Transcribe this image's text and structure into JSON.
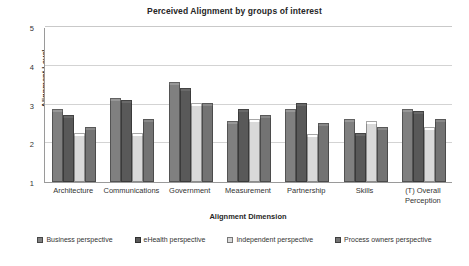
{
  "chart_data": {
    "type": "bar",
    "title": "Perceived Alignment by groups of interest",
    "xlabel": "Alignment Dimension",
    "ylabel": "Alignment Level",
    "ylim": [
      1,
      5
    ],
    "yticks": [
      1,
      2,
      3,
      4,
      5
    ],
    "grid": true,
    "legend_position": "bottom",
    "categories": [
      "Architecture",
      "Communications",
      "Government",
      "Measurement",
      "Partnership",
      "Skills",
      "(T) Overall Perception"
    ],
    "series": [
      {
        "name": "Business perspective",
        "color": "#808080",
        "values": [
          2.8,
          3.1,
          3.5,
          2.5,
          2.8,
          2.55,
          2.8
        ]
      },
      {
        "name": "eHealth perspective",
        "color": "#595959",
        "values": [
          2.65,
          3.05,
          3.35,
          2.8,
          2.95,
          2.2,
          2.75
        ]
      },
      {
        "name": "Independent perspective",
        "color": "#d9d9d9",
        "values": [
          2.2,
          2.2,
          2.95,
          2.55,
          2.15,
          2.5,
          2.35
        ]
      },
      {
        "name": "Process owners perspective",
        "color": "#737373",
        "values": [
          2.35,
          2.55,
          2.95,
          2.65,
          2.45,
          2.35,
          2.55
        ]
      }
    ]
  }
}
